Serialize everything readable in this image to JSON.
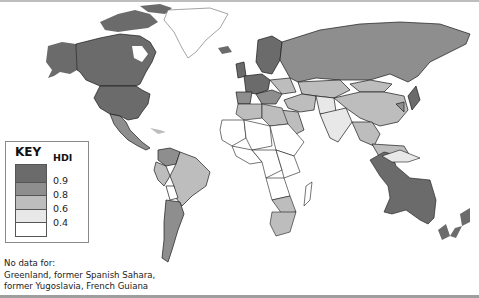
{
  "map": {
    "title_key": "KEY",
    "legend_title": "HDI",
    "legend": [
      {
        "range": "above 0.9",
        "color": "#6b6b6b"
      },
      {
        "range": "0.8 - 0.9",
        "color": "#8e8e8e"
      },
      {
        "range": "0.6 - 0.8",
        "color": "#bdbdbd"
      },
      {
        "range": "0.4 - 0.6",
        "color": "#e8e8e8"
      },
      {
        "range": "below 0.4",
        "color": "#ffffff"
      }
    ],
    "ticks": [
      "0.9",
      "0.8",
      "0.6",
      "0.4"
    ],
    "no_data_label": "No data for:",
    "no_data_line1": "Greenland, former Spanish Sahara,",
    "no_data_line2": "former Yugoslavia, French Guiana",
    "colors": {
      "very_high": "#6b6b6b",
      "high": "#8e8e8e",
      "medium": "#bdbdbd",
      "low_medium": "#e8e8e8",
      "low": "#ffffff",
      "border": "#1a1a1a",
      "ocean": "#ffffff"
    }
  }
}
